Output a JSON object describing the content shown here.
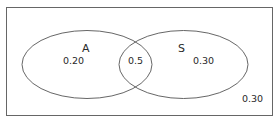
{
  "diagram": {
    "type": "venn",
    "universe": {
      "value_label": "0.30"
    },
    "sets": [
      {
        "name": "A",
        "only_value": "0.20"
      },
      {
        "name": "S",
        "only_value": "0.30"
      }
    ],
    "intersection": {
      "value_label": "0.5"
    }
  },
  "colors": {
    "stroke": "#555555",
    "text": "#2a2a2a",
    "background": "#ffffff"
  }
}
